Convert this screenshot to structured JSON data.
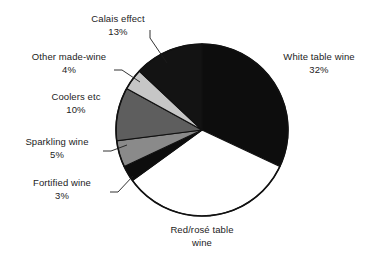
{
  "chart_data": {
    "type": "pie",
    "title": "",
    "subtitle": "",
    "xlabel": "",
    "ylabel": "",
    "legend_position": "none",
    "grid": false,
    "units": "percent",
    "start_angle_deg": 0,
    "direction": "clockwise",
    "center": {
      "x": 202,
      "y": 130
    },
    "radius": 86,
    "categories": [
      "White table wine",
      "Red/rosé table wine",
      "Fortified wine",
      "Sparkling wine",
      "Coolers etc",
      "Other made-wine",
      "Calais effect"
    ],
    "values": [
      32,
      33,
      3,
      5,
      10,
      4,
      13
    ],
    "slices": [
      {
        "name": "White table wine",
        "value": 32,
        "value_label": "32%",
        "label_line1": "White table wine",
        "label_line2": "32%",
        "color": "#0d0d0d",
        "start_deg": 0,
        "end_deg": 115.2
      },
      {
        "name": "Red/rosé table wine",
        "value": 33,
        "value_label": "",
        "label_line1": "Red/rosé table",
        "label_line2": "wine",
        "color": "#ffffff",
        "start_deg": 115.2,
        "end_deg": 234.0
      },
      {
        "name": "Fortified wine",
        "value": 3,
        "value_label": "3%",
        "label_line1": "Fortified wine",
        "label_line2": "3%",
        "color": "#0d0d0d",
        "start_deg": 234.0,
        "end_deg": 244.8
      },
      {
        "name": "Sparkling wine",
        "value": 5,
        "value_label": "5%",
        "label_line1": "Sparkling wine",
        "label_line2": "5%",
        "color": "#8a8a8a",
        "start_deg": 244.8,
        "end_deg": 262.8
      },
      {
        "name": "Coolers etc",
        "value": 10,
        "value_label": "10%",
        "label_line1": "Coolers etc",
        "label_line2": "10%",
        "color": "#5e5e5e",
        "start_deg": 262.8,
        "end_deg": 298.8
      },
      {
        "name": "Other made-wine",
        "value": 4,
        "value_label": "4%",
        "label_line1": "Other made-wine",
        "label_line2": "4%",
        "color": "#c6c6c6",
        "start_deg": 298.8,
        "end_deg": 313.2
      },
      {
        "name": "Calais effect",
        "value": 13,
        "value_label": "13%",
        "label_line1": "Calais effect",
        "label_line2": "13%",
        "color": "#131313",
        "start_deg": 313.2,
        "end_deg": 360.0
      }
    ],
    "colors": {
      "outline": "#111111",
      "background": "#ffffff",
      "text": "#1c1c1c",
      "leader_line": "#1c1c1c"
    }
  },
  "labels": {
    "calais": {
      "line1": "Calais effect",
      "line2": "13%"
    },
    "other_made_wine": {
      "line1": "Other made-wine",
      "line2": "4%"
    },
    "coolers": {
      "line1": "Coolers etc",
      "line2": "10%"
    },
    "sparkling": {
      "line1": "Sparkling wine",
      "line2": "5%"
    },
    "fortified": {
      "line1": "Fortified wine",
      "line2": "3%"
    },
    "white_table": {
      "line1": "White table wine",
      "line2": "32%"
    },
    "red_rose": {
      "line1": "Red/rosé table",
      "line2": "wine"
    }
  }
}
